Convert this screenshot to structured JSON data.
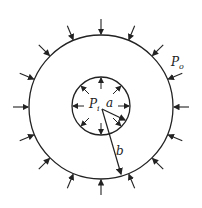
{
  "diagram": {
    "labels": {
      "outer_pressure": "P",
      "outer_pressure_sub": "o",
      "inner_pressure": "P",
      "inner_pressure_sub": "i",
      "inner_radius": "a",
      "outer_radius": "b"
    },
    "geometry": {
      "center": [
        101,
        107
      ],
      "outer_radius_px": 72,
      "inner_radius_px": 29,
      "outer_arrow_count": 16,
      "inner_arrow_count": 8
    },
    "colors": {
      "stroke": "#222222",
      "background": "#ffffff"
    }
  }
}
